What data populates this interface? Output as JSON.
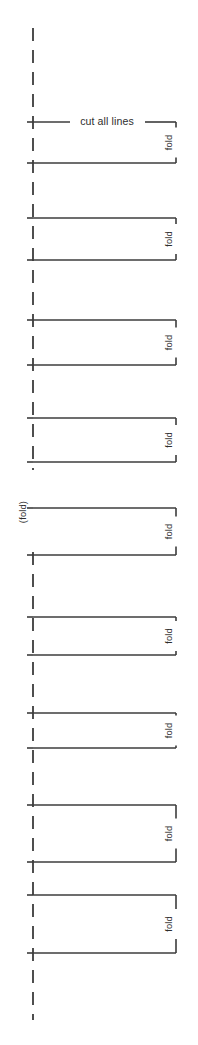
{
  "page": {
    "width": 198,
    "height": 1045,
    "background_color": "#ffffff",
    "line_color": "#3c3c3c"
  },
  "labels": {
    "cut_all_lines": "cut all lines",
    "fold": "fold",
    "fold_parenthetical": "(fold)"
  },
  "geometry": {
    "dash_x": 33,
    "dash_top_y": 28,
    "dash_bottom_y": 1020,
    "dash_gap_top_y": 470,
    "dash_gap_bottom_y": 552,
    "bracket_left_x": 33,
    "bracket_right_x": 176,
    "tick_left_x": 27,
    "fold_text_x": 170
  },
  "brackets": [
    {
      "index": 1,
      "top_y": 122,
      "bottom_y": 163,
      "fold_label": "fold",
      "has_cut_label": true
    },
    {
      "index": 2,
      "top_y": 218,
      "bottom_y": 260,
      "fold_label": "fold",
      "has_cut_label": false
    },
    {
      "index": 3,
      "top_y": 320,
      "bottom_y": 365,
      "fold_label": "fold",
      "has_cut_label": false
    },
    {
      "index": 4,
      "top_y": 418,
      "bottom_y": 462,
      "fold_label": "fold",
      "has_cut_label": false
    },
    {
      "index": 5,
      "top_y": 508,
      "bottom_y": 555,
      "fold_label": "fold",
      "has_cut_label": false
    },
    {
      "index": 6,
      "top_y": 617,
      "bottom_y": 655,
      "fold_label": "fold",
      "has_cut_label": false
    },
    {
      "index": 7,
      "top_y": 713,
      "bottom_y": 748,
      "fold_label": "fold",
      "has_cut_label": false
    },
    {
      "index": 8,
      "top_y": 805,
      "bottom_y": 862,
      "fold_label": "fold",
      "has_cut_label": false
    },
    {
      "index": 9,
      "top_y": 895,
      "bottom_y": 953,
      "fold_label": "fold",
      "has_cut_label": false
    }
  ],
  "fold_side_label": {
    "text": "(fold)",
    "x": 24,
    "y": 512
  }
}
